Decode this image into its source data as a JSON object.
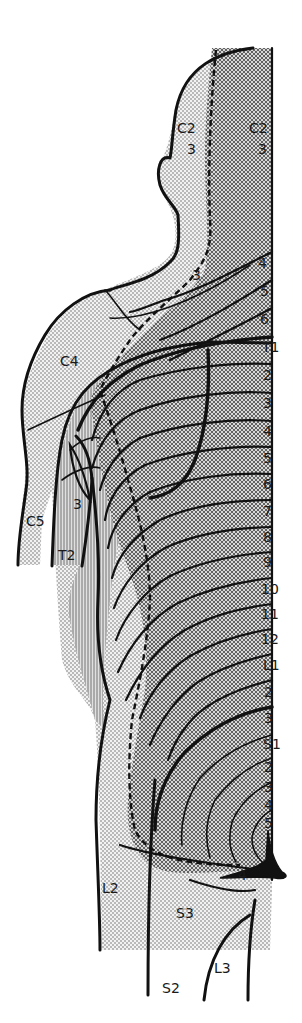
{
  "figure": {
    "type": "dermatome-map",
    "view": "posterior, upper body (head to thigh)",
    "colors": {
      "background": "#ffffff",
      "ink": "#111111",
      "light_stipple": "#d9d9d9",
      "dark_crosshatch": "#a8a8a8",
      "vertical_hatch": "#bdbdbd"
    }
  },
  "labels": {
    "head_left_c2": "C2",
    "head_left_3": "3",
    "head_right_c2": "C2",
    "head_right_3": "3",
    "neck_3": "3",
    "shoulder_c4": "C4",
    "arm_c5": "C5",
    "arm_t2": "T2",
    "arm_3": "3",
    "thigh_l2": "L2",
    "thigh_s3": "S3",
    "thigh_s2": "S2",
    "thigh_l3": "L3",
    "buttock_4": "4"
  },
  "spine_labels": [
    {
      "text": "4"
    },
    {
      "text": "5"
    },
    {
      "text": "6"
    },
    {
      "text": "T1"
    },
    {
      "text": "2"
    },
    {
      "text": "3"
    },
    {
      "text": "4"
    },
    {
      "text": "5"
    },
    {
      "text": "6"
    },
    {
      "text": "7"
    },
    {
      "text": "8"
    },
    {
      "text": "9"
    },
    {
      "text": "10"
    },
    {
      "text": "11"
    },
    {
      "text": "12"
    },
    {
      "text": "L1"
    },
    {
      "text": "2"
    },
    {
      "text": "3"
    },
    {
      "text": "S1"
    },
    {
      "text": "2"
    },
    {
      "text": "3"
    },
    {
      "text": "4"
    },
    {
      "text": "5"
    }
  ]
}
